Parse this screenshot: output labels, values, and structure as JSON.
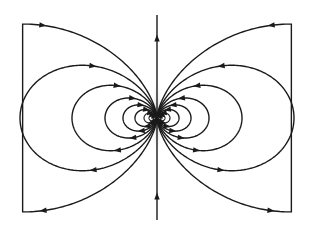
{
  "diagram": {
    "center": {
      "x": 157,
      "y": 118
    },
    "line_color": "#1a1a1a",
    "dipole_glow_color": "#c8c8c8",
    "axis_line": {
      "x": 157,
      "y_top": 15,
      "y_bottom": 220,
      "arrow_direction": "up",
      "arrow_positions_y": [
        38,
        196
      ]
    },
    "closed_loop_widths": [
      137,
      85,
      52,
      34,
      22,
      13,
      8,
      4
    ],
    "open_line_constants": [
      244
    ],
    "open_line_endpoints": {
      "left_x": 20,
      "right_x": 294
    }
  }
}
